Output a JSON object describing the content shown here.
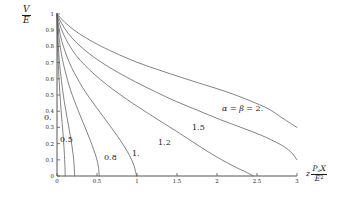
{
  "chart_data": {
    "type": "line",
    "title": "",
    "xlabel": "z P_o X / E^2",
    "ylabel": "V / E",
    "xlim": [
      0,
      3
    ],
    "ylim": [
      0,
      1
    ],
    "xticks": [
      "0",
      "0.5",
      "1",
      "1.5",
      "2",
      "2.5",
      "3"
    ],
    "xtick_values": [
      0,
      0.5,
      1,
      1.5,
      2,
      2.5,
      3
    ],
    "yticks": [
      "0",
      "0.1",
      "0.2",
      "0.3",
      "0.4",
      "0.5",
      "0.6",
      "0.7",
      "0.8",
      "0.9",
      "1"
    ],
    "ytick_values": [
      0,
      0.1,
      0.2,
      0.3,
      0.4,
      0.5,
      0.6,
      0.7,
      0.8,
      0.9,
      1
    ],
    "grid": false,
    "legend_position": "inline-curve-labels",
    "series": [
      {
        "name": "0.",
        "label": "0.",
        "parameter": 0.0,
        "points": [
          [
            0,
            1
          ],
          [
            0.002,
            0.93
          ],
          [
            0.005,
            0.86
          ],
          [
            0.009,
            0.79
          ],
          [
            0.014,
            0.72
          ],
          [
            0.02,
            0.65
          ],
          [
            0.027,
            0.585
          ],
          [
            0.035,
            0.52
          ],
          [
            0.044,
            0.455
          ],
          [
            0.053,
            0.395
          ],
          [
            0.063,
            0.335
          ],
          [
            0.073,
            0.275
          ],
          [
            0.082,
            0.215
          ],
          [
            0.09,
            0.155
          ],
          [
            0.096,
            0.1
          ],
          [
            0.1,
            0.05
          ],
          [
            0.102,
            0.0
          ]
        ]
      },
      {
        "name": "0.5",
        "label": "0.5",
        "parameter": 0.5,
        "points": [
          [
            0,
            1
          ],
          [
            0.004,
            0.93
          ],
          [
            0.01,
            0.86
          ],
          [
            0.018,
            0.79
          ],
          [
            0.028,
            0.72
          ],
          [
            0.04,
            0.655
          ],
          [
            0.055,
            0.59
          ],
          [
            0.072,
            0.525
          ],
          [
            0.091,
            0.46
          ],
          [
            0.112,
            0.4
          ],
          [
            0.133,
            0.34
          ],
          [
            0.155,
            0.28
          ],
          [
            0.176,
            0.22
          ],
          [
            0.194,
            0.16
          ],
          [
            0.208,
            0.105
          ],
          [
            0.216,
            0.05
          ],
          [
            0.22,
            0.0
          ]
        ]
      },
      {
        "name": "0.8",
        "label": "0.8",
        "parameter": 0.8,
        "points": [
          [
            0,
            1
          ],
          [
            0.01,
            0.93
          ],
          [
            0.024,
            0.86
          ],
          [
            0.043,
            0.79
          ],
          [
            0.068,
            0.72
          ],
          [
            0.098,
            0.655
          ],
          [
            0.133,
            0.59
          ],
          [
            0.173,
            0.525
          ],
          [
            0.217,
            0.465
          ],
          [
            0.264,
            0.405
          ],
          [
            0.313,
            0.345
          ],
          [
            0.363,
            0.285
          ],
          [
            0.412,
            0.225
          ],
          [
            0.457,
            0.165
          ],
          [
            0.494,
            0.11
          ],
          [
            0.518,
            0.055
          ],
          [
            0.528,
            0.0
          ]
        ]
      },
      {
        "name": "1.",
        "label": "1.",
        "parameter": 1.0,
        "points": [
          [
            0,
            1
          ],
          [
            0.018,
            0.93
          ],
          [
            0.044,
            0.865
          ],
          [
            0.08,
            0.8
          ],
          [
            0.126,
            0.735
          ],
          [
            0.182,
            0.67
          ],
          [
            0.247,
            0.61
          ],
          [
            0.321,
            0.545
          ],
          [
            0.403,
            0.485
          ],
          [
            0.49,
            0.425
          ],
          [
            0.58,
            0.365
          ],
          [
            0.67,
            0.305
          ],
          [
            0.757,
            0.245
          ],
          [
            0.838,
            0.185
          ],
          [
            0.908,
            0.125
          ],
          [
            0.962,
            0.065
          ],
          [
            0.995,
            0.0
          ]
        ]
      },
      {
        "name": "1.2",
        "label": "1.2",
        "parameter": 1.2,
        "points": [
          [
            0,
            1
          ],
          [
            0.034,
            0.935
          ],
          [
            0.082,
            0.875
          ],
          [
            0.15,
            0.81
          ],
          [
            0.238,
            0.745
          ],
          [
            0.346,
            0.685
          ],
          [
            0.473,
            0.625
          ],
          [
            0.619,
            0.565
          ],
          [
            0.782,
            0.505
          ],
          [
            0.958,
            0.445
          ],
          [
            1.144,
            0.385
          ],
          [
            1.336,
            0.325
          ],
          [
            1.528,
            0.265
          ],
          [
            1.714,
            0.205
          ],
          [
            1.888,
            0.15
          ],
          [
            2.06,
            0.1
          ],
          [
            2.23,
            0.055
          ],
          [
            2.38,
            0.02
          ],
          [
            2.455,
            0.0
          ]
        ]
      },
      {
        "name": "1.5",
        "label": "1.5",
        "parameter": 1.5,
        "points": [
          [
            0,
            1
          ],
          [
            0.06,
            0.94
          ],
          [
            0.14,
            0.88
          ],
          [
            0.25,
            0.82
          ],
          [
            0.39,
            0.76
          ],
          [
            0.56,
            0.7
          ],
          [
            0.76,
            0.64
          ],
          [
            0.985,
            0.58
          ],
          [
            1.23,
            0.52
          ],
          [
            1.49,
            0.46
          ],
          [
            1.76,
            0.405
          ],
          [
            2.03,
            0.35
          ],
          [
            2.3,
            0.3
          ],
          [
            2.56,
            0.25
          ],
          [
            2.79,
            0.195
          ],
          [
            2.92,
            0.15
          ],
          [
            3.0,
            0.1
          ]
        ]
      },
      {
        "name": "alpha = beta = 2.",
        "label": "α = β = 2.",
        "parameter": 2.0,
        "points": [
          [
            0,
            1
          ],
          [
            0.095,
            0.95
          ],
          [
            0.215,
            0.9
          ],
          [
            0.37,
            0.85
          ],
          [
            0.555,
            0.8
          ],
          [
            0.77,
            0.75
          ],
          [
            1.01,
            0.7
          ],
          [
            1.27,
            0.655
          ],
          [
            1.545,
            0.61
          ],
          [
            1.83,
            0.565
          ],
          [
            2.12,
            0.52
          ],
          [
            2.41,
            0.465
          ],
          [
            2.64,
            0.415
          ],
          [
            2.81,
            0.36
          ],
          [
            2.92,
            0.325
          ],
          [
            3.0,
            0.3
          ]
        ]
      }
    ],
    "curve_labels": [
      {
        "text": "0.",
        "x_px": 44,
        "y_px": 114
      },
      {
        "text": "0.5",
        "x_px": 60,
        "y_px": 136
      },
      {
        "text": "0.8",
        "x_px": 104,
        "y_px": 154
      },
      {
        "text": "1.",
        "x_px": 132,
        "y_px": 150
      },
      {
        "text": "1.2",
        "x_px": 158,
        "y_px": 139
      },
      {
        "text": "1.5",
        "x_px": 192,
        "y_px": 124
      },
      {
        "text": "α = β = 2.",
        "x_px": 222,
        "y_px": 105
      }
    ],
    "axis_titles": {
      "y": {
        "numerator": "V",
        "denominator": "E"
      },
      "x": {
        "leading": "z",
        "numerator_base": "P",
        "numerator_sub": "o",
        "numerator_tail": "X",
        "denominator_base": "E",
        "denominator_sup": "2"
      }
    }
  },
  "colors": {
    "background": "#ffffff",
    "axis": "#555555",
    "curve": "#5a5a5a",
    "text": "#1a1a1a"
  }
}
